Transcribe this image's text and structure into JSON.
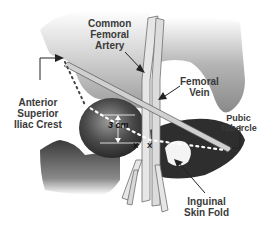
{
  "diagram": {
    "type": "anatomical-illustration",
    "labels": {
      "common_femoral_artery": [
        "Common",
        "Femoral",
        "Artery"
      ],
      "femoral_vein": [
        "Femoral",
        "Vein"
      ],
      "asis": [
        "Anterior",
        "Superior",
        "Iliac Crest"
      ],
      "pubic_tubercle": [
        "Pubic",
        "Tubercle"
      ],
      "inguinal_skin_fold": [
        "Inguinal",
        "Skin Fold"
      ]
    },
    "measurement": "3 cm",
    "puncture_marks": [
      "X",
      "X"
    ],
    "colors": {
      "pelvis_light": "#c8c8c8",
      "pelvis_dark": "#3a3a3a",
      "vessel": "#e6e6e6",
      "vessel_outline": "#6e6e6e",
      "text": "#3a3a3a"
    }
  }
}
